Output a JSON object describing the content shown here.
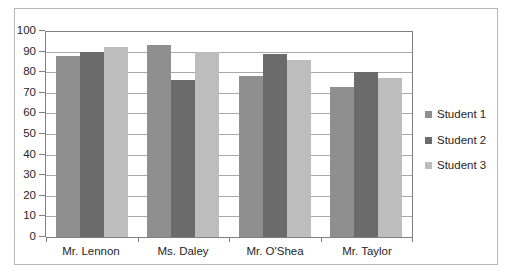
{
  "chart_data": {
    "type": "bar",
    "title": "",
    "xlabel": "",
    "ylabel": "",
    "ylim": [
      0,
      100
    ],
    "ytick_step": 10,
    "yticks": [
      "100",
      "90",
      "80",
      "70",
      "60",
      "50",
      "40",
      "30",
      "20",
      "10",
      "0"
    ],
    "grid": true,
    "legend_position": "right",
    "categories": [
      "Mr. Lennon",
      "Ms. Daley",
      "Mr. O'Shea",
      "Mr. Taylor"
    ],
    "series": [
      {
        "name": "Student 1",
        "color": "#8f8f8f",
        "values": [
          88,
          93,
          78,
          73
        ]
      },
      {
        "name": "Student 2",
        "color": "#6b6b6b",
        "values": [
          90,
          76,
          89,
          80
        ]
      },
      {
        "name": "Student 3",
        "color": "#bdbdbd",
        "values": [
          92,
          90,
          86,
          77
        ]
      }
    ]
  },
  "legend": {
    "items": [
      {
        "label": "Student 1"
      },
      {
        "label": "Student 2"
      },
      {
        "label": "Student 3"
      }
    ]
  }
}
